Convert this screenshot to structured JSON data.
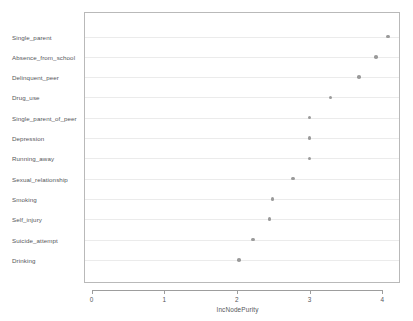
{
  "chart_data": {
    "type": "scatter",
    "title": "",
    "xlabel": "IncNodePurity",
    "ylabel": "",
    "xlim": [
      -0.1,
      4.25
    ],
    "grid": true,
    "legend": null,
    "xticks": [
      "0",
      "1",
      "2",
      "3",
      "4"
    ],
    "xtick_values": [
      0,
      1,
      2,
      3,
      4
    ],
    "categories": [
      "Single_parent",
      "Absence_from_school",
      "Delinquent_peer",
      "Drug_use",
      "Single_parent_of_peer",
      "Depression",
      "Running_away",
      "Sexual_relationship",
      "Smoking",
      "Self_injury",
      "Suicide_attempt",
      "Drinking"
    ],
    "values": [
      4.08,
      3.91,
      3.68,
      3.29,
      3.0,
      3.0,
      3.0,
      2.77,
      2.49,
      2.45,
      2.22,
      2.03
    ],
    "marker": "open-circle",
    "marker_color": "#9a9a9a",
    "grid_color": "#ebebeb",
    "frame_color": "#b9b9b9",
    "axis_color": "#9d9d9d",
    "text_color": "#55565a"
  }
}
